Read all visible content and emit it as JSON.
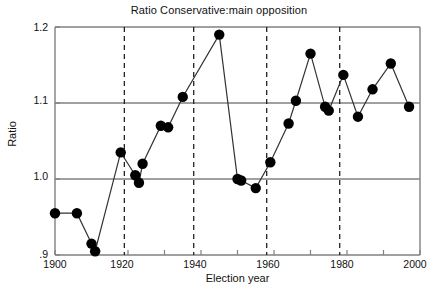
{
  "chart_data": {
    "type": "line",
    "title": "Ratio Conservative:main opposition",
    "xlabel": "Election year",
    "ylabel": "Ratio",
    "xlim": [
      1900,
      2000
    ],
    "ylim": [
      0.9,
      1.2
    ],
    "xticks": [
      1900,
      1910,
      1920,
      1930,
      1940,
      1950,
      1960,
      1970,
      1980,
      1990,
      2000
    ],
    "xtick_labels": [
      "1900",
      "",
      "1920",
      "",
      "1940",
      "",
      "1960",
      "",
      "1980",
      "",
      "2000"
    ],
    "xtick_labels_shown": [
      "1900",
      "1920",
      "1940",
      "1960",
      "1980",
      "2000"
    ],
    "yticks": [
      0.9,
      1.0,
      1.1,
      1.2
    ],
    "ytick_labels": [
      ".9",
      "1.0",
      "1.1",
      "1.2"
    ],
    "grid": "horizontal gridlines at 1.0, 1.1, 1.2",
    "marker": "filled circle",
    "marker_color": "#000000",
    "line_color": "#333333",
    "legend": "none",
    "vertical_reference_lines": {
      "style": "dashed",
      "x": [
        1919,
        1938,
        1958,
        1978
      ]
    },
    "x": [
      1900,
      1906,
      1910,
      1911,
      1918,
      1922,
      1923,
      1924,
      1929,
      1931,
      1935,
      1945,
      1950,
      1951,
      1955,
      1959,
      1964,
      1966,
      1970,
      1974,
      1975,
      1979,
      1983,
      1987,
      1992,
      1997
    ],
    "values": [
      0.955,
      0.955,
      0.915,
      0.905,
      1.035,
      1.005,
      0.995,
      1.02,
      1.07,
      1.068,
      1.108,
      1.19,
      1.0,
      0.998,
      0.988,
      1.022,
      1.073,
      1.103,
      1.165,
      1.095,
      1.09,
      1.137,
      1.082,
      1.118,
      1.152,
      1.095
    ],
    "series": [
      {
        "name": "Ratio Conservative:main opposition",
        "values": [
          0.955,
          0.955,
          0.915,
          0.905,
          1.035,
          1.005,
          0.995,
          1.02,
          1.07,
          1.068,
          1.108,
          1.19,
          1.0,
          0.998,
          0.988,
          1.022,
          1.073,
          1.103,
          1.165,
          1.095,
          1.09,
          1.137,
          1.082,
          1.118,
          1.152,
          1.095
        ]
      }
    ]
  }
}
